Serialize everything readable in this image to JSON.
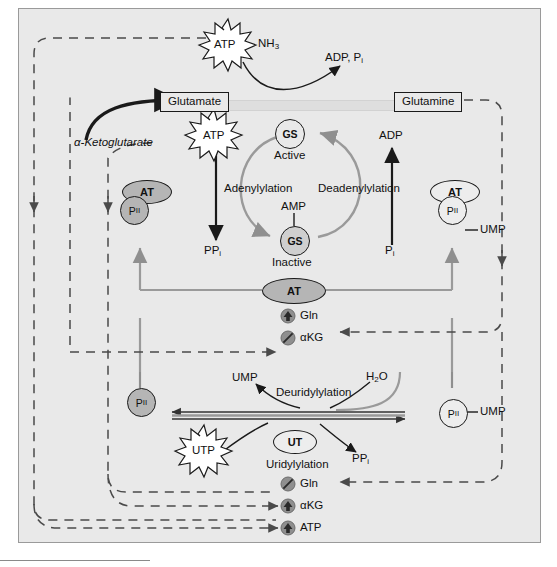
{
  "diagram": {
    "background_color": "#e9e9e9",
    "arrow_gray": "#8a8a8a",
    "arrow_black": "#1a1a1a"
  },
  "metabolite_boxes": {
    "glutamate": "Glutamate",
    "glutamine": "Glutamine"
  },
  "top_reaction": {
    "atp_burst": "ATP",
    "nh3": "NH",
    "nh3_sub": "3",
    "products": "ADP, P",
    "products_sub": "i"
  },
  "enzymes": {
    "gs_active_label": "GS",
    "gs_active_state": "Active",
    "gs_inactive_label": "GS",
    "gs_inactive_state": "Inactive",
    "amp": "AMP",
    "at_oval": "AT",
    "at_left": "AT",
    "at_right": "AT",
    "ut_oval": "UT"
  },
  "reactions": {
    "adenylylation": "Adenylylation",
    "deadenylylation": "Deadenylylation",
    "uridylylation": "Uridylylation",
    "deuridylylation": "Deuridylylation"
  },
  "substrates": {
    "alpha_ketoglutarate": "α-Ketoglutarate",
    "atp_left_burst": "ATP",
    "utp_burst": "UTP",
    "ppi_upper": "PP",
    "ppi_upper_sub": "i",
    "ppi_lower": "PP",
    "ppi_lower_sub": "i",
    "adp_right": "ADP",
    "pi_right": "P",
    "pi_right_sub": "i",
    "ump_left": "UMP",
    "ump_mid": "UMP",
    "ump_right": "UMP",
    "water": "H",
    "water_sub": "2",
    "water_tail": "O"
  },
  "pii_nodes": {
    "pii_left_upper": "P",
    "pii_left_upper_sub": "II",
    "pii_right_upper": "P",
    "pii_right_upper_sub": "II",
    "pii_left_lower": "P",
    "pii_left_lower_sub": "II",
    "pii_right_lower": "P",
    "pii_right_lower_sub": "II"
  },
  "regulators_upper": [
    {
      "name": "Gln",
      "effect": "activation",
      "icon": "up-arrow-circle-icon"
    },
    {
      "name": "αKG",
      "effect": "inhibition",
      "icon": "slash-circle-icon"
    }
  ],
  "regulators_lower": [
    {
      "name": "Gln",
      "effect": "inhibition",
      "icon": "slash-circle-icon"
    },
    {
      "name": "αKG",
      "effect": "activation",
      "icon": "up-arrow-circle-icon"
    },
    {
      "name": "ATP",
      "effect": "activation",
      "icon": "up-arrow-circle-icon"
    }
  ]
}
